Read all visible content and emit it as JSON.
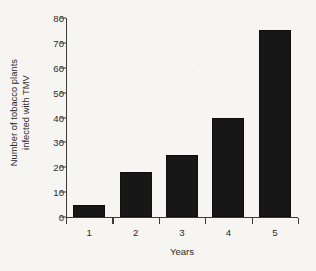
{
  "chart_data": {
    "type": "bar",
    "title": "",
    "categories": [
      "1",
      "2",
      "3",
      "4",
      "5"
    ],
    "values": [
      5,
      18,
      25,
      40,
      75
    ],
    "xlabel": "Years",
    "ylabel": "Number of tobacco plants infected with TMV",
    "ylabel_lines": [
      "Number of tobacco plants",
      "infected with TMV"
    ],
    "ylim": [
      0,
      80
    ],
    "yticks": [
      0,
      10,
      20,
      30,
      40,
      50,
      60,
      70,
      80
    ],
    "ytick_labels": [
      "0",
      "10",
      "20",
      "30",
      "40",
      "50",
      "60",
      "70",
      "80"
    ],
    "grid": false,
    "legend": null,
    "bar_color": "#171717",
    "axis_color": "#3a3a3a",
    "background_color": "#f7f5f2"
  }
}
